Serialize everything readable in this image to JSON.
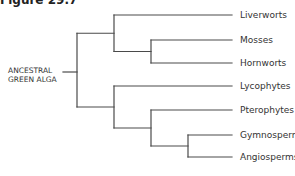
{
  "figure": {
    "title": "Figure 29.7"
  },
  "tree": {
    "root_label_lines": [
      "ANCESTRAL",
      "GREEN ALGA"
    ],
    "newick": "((Liverworts,(Mosses,Hornworts)),(Lycophytes,(Pterophytes,(Gymnosperms,Angiosperms))))",
    "root": {
      "children": [
        {
          "children": [
            {
              "name": "Liverworts"
            },
            {
              "children": [
                {
                  "name": "Mosses"
                },
                {
                  "name": "Hornworts"
                }
              ]
            }
          ]
        },
        {
          "children": [
            {
              "name": "Lycophytes"
            },
            {
              "children": [
                {
                  "name": "Pterophytes"
                },
                {
                  "children": [
                    {
                      "name": "Gymnosperms"
                    },
                    {
                      "name": "Angiosperms"
                    }
                  ]
                }
              ]
            }
          ]
        }
      ]
    },
    "taxa": [
      "Liverworts",
      "Mosses",
      "Hornworts",
      "Lycophytes",
      "Pterophytes",
      "Gymnosperms",
      "Angiosperms"
    ]
  }
}
